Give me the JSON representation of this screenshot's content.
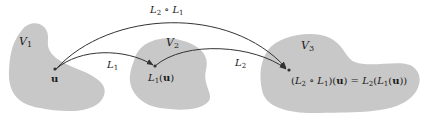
{
  "colors": {
    "region_fill": "#c8c8c8",
    "arrow": "#333333",
    "text": "#1a1a1a",
    "background": "#ffffff"
  },
  "regions": [
    {
      "id": "V1",
      "label": "V",
      "sub": "1"
    },
    {
      "id": "V2",
      "label": "V",
      "sub": "2"
    },
    {
      "id": "V3",
      "label": "V",
      "sub": "3"
    }
  ],
  "points": {
    "u": "u",
    "L1u": {
      "L": "L",
      "sub": "1",
      "open": "(",
      "arg": "u",
      "close": ")"
    }
  },
  "arrows": {
    "L1": {
      "L": "L",
      "sub": "1"
    },
    "L2": {
      "L": "L",
      "sub": "2"
    },
    "composite": {
      "L2": "L",
      "sub2": "2",
      "op": "∘",
      "L1": "L",
      "sub1": "1"
    }
  },
  "equation": {
    "lhs_open": "(",
    "L2": "L",
    "sub2": "2",
    "op": " ∘ ",
    "L1": "L",
    "sub1": "1",
    "lhs_close": ")(",
    "u": "u",
    "eq": ") = ",
    "rL2": "L",
    "rsub2": "2",
    "rparen1": "(",
    "rL1": "L",
    "rsub1": "1",
    "rparen2": "(",
    "ru": "u",
    "rclose": "))"
  }
}
